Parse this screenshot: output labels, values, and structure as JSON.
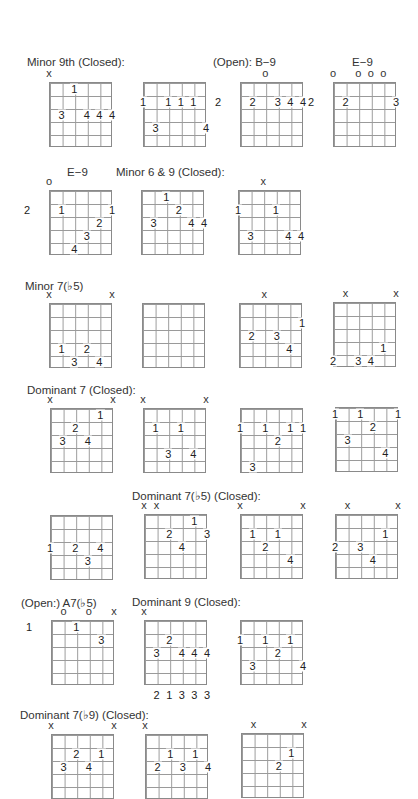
{
  "labels": [
    {
      "text": "Minor 9th (Closed):",
      "x": 27,
      "y": 56
    },
    {
      "text": "(Open):  B−9",
      "x": 213,
      "y": 56
    },
    {
      "text": "E−9",
      "x": 352,
      "y": 56
    },
    {
      "text": "E−9",
      "x": 67,
      "y": 166
    },
    {
      "text": "Minor 6 & 9 (Closed):",
      "x": 116,
      "y": 166
    },
    {
      "text": "Minor 7(♭5)",
      "x": 25,
      "y": 279
    },
    {
      "text": "Dominant 7 (Closed):",
      "x": 27,
      "y": 384
    },
    {
      "text": "Dominant 7(♭5) (Closed):",
      "x": 132,
      "y": 489
    },
    {
      "text": "(Open:)  A7(♭5)",
      "x": 21,
      "y": 596
    },
    {
      "text": "Dominant 9 (Closed):",
      "x": 132,
      "y": 596
    },
    {
      "text": "Dominant 7(♭9) (Closed):",
      "x": 20,
      "y": 708
    }
  ],
  "chart_data": {
    "type": "chord_diagrams",
    "note": "Each diagram: 5 columns x 5 fret rows. Strings 1-6 (low E to high e) sit on the 6 vertical lines. Fingers 1-4 shown on strings; x = muted, o = open; fret number at left.",
    "chords": [
      {
        "section": "Minor 9th (Closed)",
        "x": 49,
        "y": 82,
        "markers": [
          {
            "s": 1,
            "t": "x"
          }
        ],
        "fingers": [
          {
            "s": 3,
            "f": 1,
            "t": "1"
          },
          {
            "s": 2,
            "f": 3,
            "t": "3"
          },
          {
            "s": 4,
            "f": 3,
            "t": "4"
          },
          {
            "s": 5,
            "f": 3,
            "t": "4"
          },
          {
            "s": 6,
            "f": 3,
            "t": "4"
          }
        ],
        "fret": null,
        "bottom": []
      },
      {
        "section": "Minor 9th (Closed)",
        "x": 143,
        "y": 82,
        "markers": [],
        "fingers": [
          {
            "s": 1,
            "f": 2,
            "t": "1"
          },
          {
            "s": 3,
            "f": 2,
            "t": "1"
          },
          {
            "s": 4,
            "f": 2,
            "t": "1"
          },
          {
            "s": 5,
            "f": 2,
            "t": "1"
          },
          {
            "s": 2,
            "f": 4,
            "t": "3"
          },
          {
            "s": 6,
            "f": 4,
            "t": "4"
          }
        ],
        "fret": null,
        "bottom": []
      },
      {
        "section": "(Open): B-9",
        "x": 240,
        "y": 82,
        "markers": [
          {
            "s": 3,
            "t": "o"
          }
        ],
        "fingers": [
          {
            "s": 2,
            "f": 2,
            "t": "2"
          },
          {
            "s": 4,
            "f": 2,
            "t": "3"
          },
          {
            "s": 5,
            "f": 2,
            "t": "4"
          },
          {
            "s": 6,
            "f": 2,
            "t": "4"
          }
        ],
        "fret": "2",
        "bottom": []
      },
      {
        "section": "E-9",
        "x": 333,
        "y": 82,
        "markers": [
          {
            "s": 1,
            "t": "o"
          },
          {
            "s": 3,
            "t": "o"
          },
          {
            "s": 4,
            "t": "o"
          },
          {
            "s": 5,
            "t": "o"
          }
        ],
        "fingers": [
          {
            "s": 2,
            "f": 2,
            "t": "2"
          },
          {
            "s": 6,
            "f": 2,
            "t": "3"
          }
        ],
        "fret": "2",
        "bottom": []
      },
      {
        "section": "E-9",
        "x": 49,
        "y": 190,
        "markers": [
          {
            "s": 1,
            "t": "o"
          }
        ],
        "fingers": [
          {
            "s": 2,
            "f": 2,
            "t": "1"
          },
          {
            "s": 6,
            "f": 2,
            "t": "1"
          },
          {
            "s": 5,
            "f": 3,
            "t": "2"
          },
          {
            "s": 4,
            "f": 4,
            "t": "3"
          },
          {
            "s": 3,
            "f": 5,
            "t": "4"
          }
        ],
        "fret": "2",
        "bottom": []
      },
      {
        "section": "Minor 6 & 9 (Closed)",
        "x": 141,
        "y": 190,
        "markers": [],
        "fingers": [
          {
            "s": 3,
            "f": 1,
            "t": "1"
          },
          {
            "s": 4,
            "f": 2,
            "t": "2"
          },
          {
            "s": 2,
            "f": 3,
            "t": "3"
          },
          {
            "s": 5,
            "f": 3,
            "t": "4"
          },
          {
            "s": 6,
            "f": 3,
            "t": "4"
          }
        ],
        "fret": null,
        "bottom": []
      },
      {
        "section": "Minor 6 & 9 (Closed)",
        "x": 238,
        "y": 190,
        "markers": [
          {
            "s": 3,
            "t": "x"
          }
        ],
        "fingers": [
          {
            "s": 1,
            "f": 2,
            "t": "1"
          },
          {
            "s": 4,
            "f": 2,
            "t": "1"
          },
          {
            "s": 2,
            "f": 4,
            "t": "3"
          },
          {
            "s": 5,
            "f": 4,
            "t": "4"
          },
          {
            "s": 6,
            "f": 4,
            "t": "4"
          }
        ],
        "fret": null,
        "bottom": []
      },
      {
        "section": "Minor 7(b5)",
        "x": 49,
        "y": 303,
        "markers": [
          {
            "s": 1,
            "t": "x"
          },
          {
            "s": 6,
            "t": "x"
          }
        ],
        "fingers": [
          {
            "s": 2,
            "f": 4,
            "t": "1"
          },
          {
            "s": 4,
            "f": 4,
            "t": "2"
          },
          {
            "s": 3,
            "f": 5,
            "t": "3"
          },
          {
            "s": 5,
            "f": 5,
            "t": "4"
          }
        ],
        "fret": null,
        "bottom": []
      },
      {
        "section": "Minor 7(b5)",
        "x": 142,
        "y": 303,
        "markers": [],
        "fingers": [],
        "fret": null,
        "bottom": []
      },
      {
        "section": "Minor 7(b5)",
        "x": 239,
        "y": 303,
        "markers": [
          {
            "s": 3,
            "t": "x"
          }
        ],
        "fingers": [
          {
            "s": 6,
            "f": 2,
            "t": "1"
          },
          {
            "s": 2,
            "f": 3,
            "t": "2"
          },
          {
            "s": 4,
            "f": 3,
            "t": "3"
          },
          {
            "s": 5,
            "f": 4,
            "t": "4"
          }
        ],
        "fret": null,
        "bottom": []
      },
      {
        "section": "Minor 7(b5)",
        "x": 333,
        "y": 302,
        "markers": [
          {
            "s": 2,
            "t": "x"
          },
          {
            "s": 6,
            "t": "x"
          }
        ],
        "fingers": [
          {
            "s": 5,
            "f": 4,
            "t": "1"
          },
          {
            "s": 1,
            "f": 5,
            "t": "2"
          },
          {
            "s": 3,
            "f": 5,
            "t": "3"
          },
          {
            "s": 4,
            "f": 5,
            "t": "4"
          }
        ],
        "fret": null,
        "bottom": []
      },
      {
        "section": "Dominant 7 (Closed)",
        "x": 50,
        "y": 408,
        "markers": [
          {
            "s": 1,
            "t": "x"
          },
          {
            "s": 6,
            "t": "x"
          }
        ],
        "fingers": [
          {
            "s": 5,
            "f": 1,
            "t": "1"
          },
          {
            "s": 3,
            "f": 2,
            "t": "2"
          },
          {
            "s": 2,
            "f": 3,
            "t": "3"
          },
          {
            "s": 4,
            "f": 3,
            "t": "4"
          }
        ],
        "fret": null,
        "bottom": []
      },
      {
        "section": "Dominant 7 (Closed)",
        "x": 143,
        "y": 408,
        "markers": [
          {
            "s": 1,
            "t": "x"
          },
          {
            "s": 6,
            "t": "x"
          }
        ],
        "fingers": [
          {
            "s": 2,
            "f": 2,
            "t": "1"
          },
          {
            "s": 4,
            "f": 2,
            "t": "1"
          },
          {
            "s": 3,
            "f": 4,
            "t": "3"
          },
          {
            "s": 5,
            "f": 4,
            "t": "4"
          }
        ],
        "fret": null,
        "bottom": []
      },
      {
        "section": "Dominant 7 (Closed)",
        "x": 240,
        "y": 408,
        "markers": [],
        "fingers": [
          {
            "s": 1,
            "f": 2,
            "t": "1"
          },
          {
            "s": 3,
            "f": 2,
            "t": "1"
          },
          {
            "s": 5,
            "f": 2,
            "t": "1"
          },
          {
            "s": 6,
            "f": 2,
            "t": "1"
          },
          {
            "s": 4,
            "f": 3,
            "t": "2"
          },
          {
            "s": 2,
            "f": 5,
            "t": "3"
          }
        ],
        "fret": null,
        "bottom": []
      },
      {
        "section": "Dominant 7 (Closed)",
        "x": 335,
        "y": 407,
        "markers": [],
        "fingers": [
          {
            "s": 1,
            "f": 1,
            "t": "1"
          },
          {
            "s": 3,
            "f": 1,
            "t": "1"
          },
          {
            "s": 6,
            "f": 1,
            "t": "1"
          },
          {
            "s": 4,
            "f": 2,
            "t": "2"
          },
          {
            "s": 2,
            "f": 3,
            "t": "3"
          },
          {
            "s": 5,
            "f": 4,
            "t": "4"
          }
        ],
        "fret": null,
        "bottom": []
      },
      {
        "section": "Dominant 7(b5) (Closed)",
        "x": 50,
        "y": 515,
        "markers": [],
        "fingers": [
          {
            "s": 1,
            "f": 3,
            "t": "1"
          },
          {
            "s": 3,
            "f": 3,
            "t": "2"
          },
          {
            "s": 5,
            "f": 3,
            "t": "4"
          },
          {
            "s": 4,
            "f": 4,
            "t": "3"
          }
        ],
        "fret": null,
        "bottom": []
      },
      {
        "section": "Dominant 7(b5) (Closed)",
        "x": 144,
        "y": 514,
        "markers": [
          {
            "s": 1,
            "t": "x"
          },
          {
            "s": 2,
            "t": "x"
          }
        ],
        "fingers": [
          {
            "s": 5,
            "f": 1,
            "t": "1"
          },
          {
            "s": 3,
            "f": 2,
            "t": "2"
          },
          {
            "s": 6,
            "f": 2,
            "t": "3"
          },
          {
            "s": 4,
            "f": 3,
            "t": "4"
          }
        ],
        "fret": null,
        "bottom": []
      },
      {
        "section": "Dominant 7(b5) (Closed)",
        "x": 240,
        "y": 514,
        "markers": [
          {
            "s": 1,
            "t": "x"
          },
          {
            "s": 6,
            "t": "x"
          }
        ],
        "fingers": [
          {
            "s": 2,
            "f": 2,
            "t": "1"
          },
          {
            "s": 4,
            "f": 2,
            "t": "1"
          },
          {
            "s": 3,
            "f": 3,
            "t": "2"
          },
          {
            "s": 5,
            "f": 4,
            "t": "4"
          }
        ],
        "fret": null,
        "bottom": []
      },
      {
        "section": "Dominant 7(b5) (Closed)",
        "x": 335,
        "y": 514,
        "markers": [
          {
            "s": 2,
            "t": "x"
          },
          {
            "s": 6,
            "t": "x"
          }
        ],
        "fingers": [
          {
            "s": 5,
            "f": 2,
            "t": "1"
          },
          {
            "s": 1,
            "f": 3,
            "t": "2"
          },
          {
            "s": 3,
            "f": 3,
            "t": "3"
          },
          {
            "s": 4,
            "f": 4,
            "t": "4"
          }
        ],
        "fret": null,
        "bottom": []
      },
      {
        "section": "(Open:) A7(b5)",
        "x": 51,
        "y": 620,
        "markers": [
          {
            "s": 2,
            "t": "o"
          },
          {
            "s": 4,
            "t": "o"
          },
          {
            "s": 6,
            "t": "x"
          }
        ],
        "fingers": [
          {
            "s": 3,
            "f": 1,
            "t": "1"
          },
          {
            "s": 5,
            "f": 2,
            "t": "3"
          }
        ],
        "fret": "1",
        "bottom": []
      },
      {
        "section": "Dominant 9 (Closed)",
        "x": 144,
        "y": 620,
        "markers": [
          {
            "s": 1,
            "t": "x"
          }
        ],
        "fingers": [
          {
            "s": 3,
            "f": 2,
            "t": "2"
          },
          {
            "s": 2,
            "f": 3,
            "t": "3"
          },
          {
            "s": 4,
            "f": 3,
            "t": "4"
          },
          {
            "s": 5,
            "f": 3,
            "t": "4"
          },
          {
            "s": 6,
            "f": 3,
            "t": "4"
          }
        ],
        "fret": null,
        "bottom": [
          "2",
          "1",
          "3",
          "3",
          "3"
        ]
      },
      {
        "section": "Dominant 9 (Closed)",
        "x": 240,
        "y": 620,
        "markers": [],
        "fingers": [
          {
            "s": 1,
            "f": 2,
            "t": "1"
          },
          {
            "s": 3,
            "f": 2,
            "t": "1"
          },
          {
            "s": 5,
            "f": 2,
            "t": "1"
          },
          {
            "s": 4,
            "f": 3,
            "t": "2"
          },
          {
            "s": 2,
            "f": 4,
            "t": "3"
          },
          {
            "s": 6,
            "f": 4,
            "t": "4"
          }
        ],
        "fret": null,
        "bottom": []
      },
      {
        "section": "Dominant 7(b9) (Closed)",
        "x": 51,
        "y": 734,
        "markers": [
          {
            "s": 1,
            "t": "x"
          },
          {
            "s": 6,
            "t": "x"
          }
        ],
        "fingers": [
          {
            "s": 3,
            "f": 2,
            "t": "2"
          },
          {
            "s": 5,
            "f": 2,
            "t": "1"
          },
          {
            "s": 2,
            "f": 3,
            "t": "3"
          },
          {
            "s": 4,
            "f": 3,
            "t": "4"
          }
        ],
        "fret": null,
        "bottom": []
      },
      {
        "section": "Dominant 7(b9) (Closed)",
        "x": 145,
        "y": 734,
        "markers": [
          {
            "s": 1,
            "t": "x"
          }
        ],
        "fingers": [
          {
            "s": 3,
            "f": 2,
            "t": "1"
          },
          {
            "s": 5,
            "f": 2,
            "t": "1"
          },
          {
            "s": 2,
            "f": 3,
            "t": "2"
          },
          {
            "s": 4,
            "f": 3,
            "t": "3"
          },
          {
            "s": 6,
            "f": 3,
            "t": "4"
          }
        ],
        "fret": null,
        "bottom": []
      },
      {
        "section": "Dominant 7(b9) (Closed)",
        "x": 241,
        "y": 733,
        "markers": [
          {
            "s": 2,
            "t": "x"
          },
          {
            "s": 6,
            "t": "x"
          }
        ],
        "fingers": [
          {
            "s": 5,
            "f": 2,
            "t": "1"
          },
          {
            "s": 4,
            "f": 3,
            "t": "2"
          }
        ],
        "fret": null,
        "bottom": []
      }
    ]
  }
}
